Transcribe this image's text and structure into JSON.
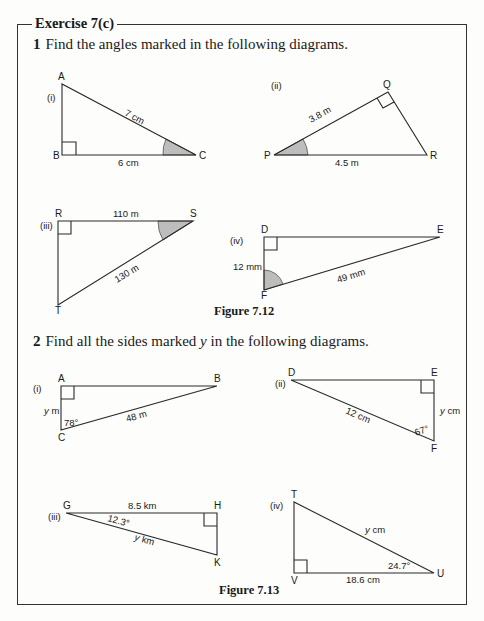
{
  "exercise": {
    "title": "Exercise 7(c)"
  },
  "question1": {
    "number": "1",
    "text": "Find the angles marked in the following diagrams.",
    "figure_caption": "Figure 7.12",
    "diagrams": [
      {
        "label": "(i)",
        "vertices": [
          "A",
          "B",
          "C"
        ],
        "sides": {
          "hyp": "7 cm",
          "base": "6 cm"
        }
      },
      {
        "label": "(ii)",
        "vertices": [
          "Q",
          "P",
          "R"
        ],
        "sides": {
          "pq": "3.8 m",
          "pr": "4.5 m"
        }
      },
      {
        "label": "(iii)",
        "vertices": [
          "R",
          "S",
          "T"
        ],
        "sides": {
          "rs": "110 m",
          "st": "130 m"
        }
      },
      {
        "label": "(iv)",
        "vertices": [
          "D",
          "E",
          "F"
        ],
        "sides": {
          "df": "12 mm",
          "ef": "49 mm"
        }
      }
    ]
  },
  "question2": {
    "number": "2",
    "text_before": "Find all the sides marked ",
    "var": "y",
    "text_after": " in the following diagrams.",
    "figure_caption": "Figure 7.13",
    "diagrams": [
      {
        "label": "(i)",
        "vertices": [
          "A",
          "B",
          "C"
        ],
        "sides": {
          "ac": "y m",
          "bc": "48 m"
        },
        "angle": "78°"
      },
      {
        "label": "(ii)",
        "vertices": [
          "D",
          "E",
          "F"
        ],
        "sides": {
          "df": "12 cm",
          "ef": "y cm"
        },
        "angle": "67°"
      },
      {
        "label": "(iii)",
        "vertices": [
          "G",
          "H",
          "K"
        ],
        "sides": {
          "gh": "8.5 km",
          "gk": "y km"
        },
        "angle": "12.3°"
      },
      {
        "label": "(iv)",
        "vertices": [
          "T",
          "V",
          "U"
        ],
        "sides": {
          "tu": "y cm",
          "vu": "18.6 cm"
        },
        "angle": "24.7°"
      }
    ]
  }
}
